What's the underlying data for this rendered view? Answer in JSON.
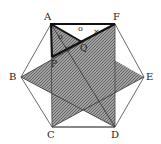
{
  "diagram": {
    "vertices": {
      "A": {
        "label": "A",
        "x": 51,
        "y": 24
      },
      "F": {
        "label": "F",
        "x": 115,
        "y": 24
      },
      "B": {
        "label": "B",
        "x": 21,
        "y": 77
      },
      "E": {
        "label": "E",
        "x": 144,
        "y": 77
      },
      "C": {
        "label": "C",
        "x": 52,
        "y": 127
      },
      "D": {
        "label": "D",
        "x": 115,
        "y": 127
      }
    },
    "points": {
      "P": {
        "label": "P",
        "x": 52,
        "y": 57
      },
      "Q": {
        "label": "Q",
        "x": 82,
        "y": 42
      }
    },
    "marks": {
      "circle": "o",
      "tick": "×"
    },
    "colors": {
      "line": "#333333",
      "shade": "#8a8a8a",
      "background": "#ffffff"
    }
  }
}
